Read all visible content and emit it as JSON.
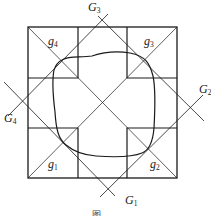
{
  "figure": {
    "caption_partial": "图",
    "labels": {
      "G1": {
        "base": "G",
        "sub": "1"
      },
      "G2": {
        "base": "G",
        "sub": "2"
      },
      "G3": {
        "base": "G",
        "sub": "3"
      },
      "G4": {
        "base": "G",
        "sub": "4"
      },
      "g1": {
        "base": "g",
        "sub": "1"
      },
      "g2": {
        "base": "g",
        "sub": "2"
      },
      "g3": {
        "base": "g",
        "sub": "3"
      },
      "g4": {
        "base": "g",
        "sub": "4"
      }
    },
    "colors": {
      "stroke": "#1a1a1a",
      "background": "#ffffff"
    }
  }
}
